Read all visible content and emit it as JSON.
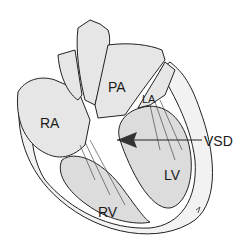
{
  "diagram": {
    "labels": {
      "ra": "RA",
      "pa": "PA",
      "la": "LA",
      "lv": "LV",
      "rv": "RV",
      "vsd": "VSD"
    },
    "colors": {
      "outline": "#222222",
      "chamber_fill": "#e6e6e6",
      "dark_fill": "#bdbdbd",
      "background": "#ffffff"
    }
  }
}
